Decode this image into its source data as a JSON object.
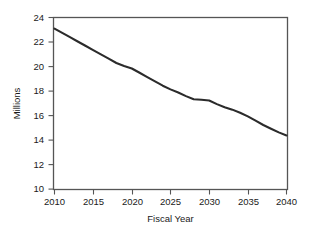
{
  "chart_data": {
    "type": "line",
    "title": "",
    "subtitle": "",
    "xlabel": "Fiscal Year",
    "ylabel": "Millions",
    "xlim": [
      2010,
      2040
    ],
    "ylim": [
      10,
      24
    ],
    "xticks": [
      2010,
      2015,
      2020,
      2025,
      2030,
      2035,
      2040
    ],
    "xtick_labels": [
      "2010",
      "2015",
      "2020",
      "2025",
      "2030",
      "2035",
      "2040"
    ],
    "yticks": [
      10,
      12,
      14,
      16,
      18,
      20,
      22,
      24
    ],
    "ytick_labels": [
      "10",
      "12",
      "14",
      "16",
      "18",
      "20",
      "22",
      "24"
    ],
    "grid": false,
    "legend": false,
    "legend_position": "none",
    "frame": "box",
    "line_color": "#2b2b2b",
    "axis_color": "#555555",
    "background": "#ffffff",
    "x": [
      2010,
      2011,
      2012,
      2013,
      2014,
      2015,
      2016,
      2017,
      2018,
      2019,
      2020,
      2021,
      2022,
      2023,
      2024,
      2025,
      2026,
      2027,
      2028,
      2029,
      2030,
      2031,
      2032,
      2033,
      2034,
      2035,
      2036,
      2037,
      2038,
      2039,
      2040
    ],
    "series": [
      {
        "name": "Projected",
        "values": [
          23.1,
          22.75,
          22.4,
          22.05,
          21.7,
          21.35,
          21.0,
          20.65,
          20.3,
          20.05,
          19.85,
          19.5,
          19.15,
          18.8,
          18.45,
          18.15,
          17.9,
          17.6,
          17.35,
          17.3,
          17.25,
          16.95,
          16.7,
          16.5,
          16.25,
          15.95,
          15.6,
          15.25,
          14.95,
          14.65,
          14.4
        ]
      }
    ]
  },
  "axis": {
    "y_title": "Millions",
    "x_title": "Fiscal Year"
  }
}
